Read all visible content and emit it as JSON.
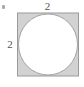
{
  "figure": {
    "kind": "geometry-diagram",
    "background_color": "#ffffff",
    "width": 84,
    "height": 87
  },
  "square": {
    "name": "outer-square",
    "fill_color": "#d2d2d2",
    "stroke_color": "#9a9a9a",
    "stroke_width": 1,
    "x": 17,
    "y": 12.5,
    "side_px": 62,
    "side_label": "2"
  },
  "circle": {
    "name": "inscribed-circle",
    "fill_color": "#ffffff",
    "stroke_color": "#a4a4a4",
    "stroke_width": 1,
    "cx": 48,
    "cy": 43.5,
    "r": 30,
    "diameter_label": "2"
  },
  "labels": {
    "top": {
      "text": "2",
      "color": "#555555",
      "position": "above-top-edge"
    },
    "left": {
      "text": "2",
      "color": "#555555",
      "position": "left-of-left-edge"
    }
  },
  "artifact": {
    "name": "corner-speck",
    "color": "#9b9b9b"
  }
}
